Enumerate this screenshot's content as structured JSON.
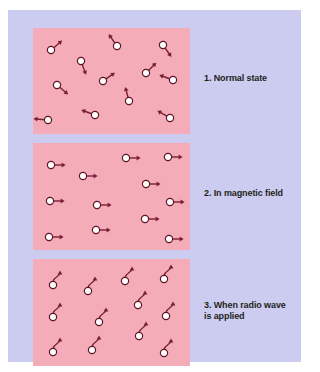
{
  "figure": {
    "background_color": "#ccccf0",
    "panel_color": "#f4adb8",
    "particle_fill": "#ffffff",
    "particle_stroke": "#5c1424",
    "arrow_color": "#7a1f33"
  },
  "captions": {
    "panel_1": "1. Normal state",
    "panel_2": "2. In magnetic field",
    "panel_3": "3. When radio wave\nis applied"
  },
  "chart_data": {
    "type": "diagram",
    "panels": [
      {
        "id": "panel-1",
        "label": "1. Normal state",
        "description": "Spins randomly oriented",
        "arrow_style": "straight",
        "particles": [
          {
            "x": 18,
            "y": 22,
            "angle": -40
          },
          {
            "x": 48,
            "y": 33,
            "angle": 70
          },
          {
            "x": 84,
            "y": 18,
            "angle": -125
          },
          {
            "x": 130,
            "y": 17,
            "angle": 55
          },
          {
            "x": 24,
            "y": 57,
            "angle": 40
          },
          {
            "x": 70,
            "y": 53,
            "angle": -35
          },
          {
            "x": 113,
            "y": 45,
            "angle": -45
          },
          {
            "x": 140,
            "y": 52,
            "angle": -160
          },
          {
            "x": 96,
            "y": 73,
            "angle": -105
          },
          {
            "x": 15,
            "y": 92,
            "angle": 185
          },
          {
            "x": 62,
            "y": 87,
            "angle": -160
          },
          {
            "x": 137,
            "y": 90,
            "angle": -150
          }
        ]
      },
      {
        "id": "panel-2",
        "label": "2. In magnetic field",
        "description": "Spins aligned pointing right",
        "arrow_style": "straight",
        "particles": [
          {
            "x": 18,
            "y": 22,
            "angle": 0
          },
          {
            "x": 50,
            "y": 33,
            "angle": 0
          },
          {
            "x": 93,
            "y": 15,
            "angle": 0
          },
          {
            "x": 135,
            "y": 14,
            "angle": 0
          },
          {
            "x": 113,
            "y": 41,
            "angle": 0
          },
          {
            "x": 17,
            "y": 58,
            "angle": 0
          },
          {
            "x": 64,
            "y": 62,
            "angle": 0
          },
          {
            "x": 137,
            "y": 59,
            "angle": 0
          },
          {
            "x": 112,
            "y": 76,
            "angle": 0
          },
          {
            "x": 16,
            "y": 94,
            "angle": 0
          },
          {
            "x": 63,
            "y": 87,
            "angle": 0
          },
          {
            "x": 136,
            "y": 96,
            "angle": 0
          }
        ]
      },
      {
        "id": "panel-3",
        "label": "3. When radio wave is applied",
        "description": "Spins precessing, curved arrows up-right",
        "arrow_style": "curved",
        "particles": [
          {
            "x": 20,
            "y": 26,
            "angle": 0
          },
          {
            "x": 55,
            "y": 32,
            "angle": 0
          },
          {
            "x": 92,
            "y": 22,
            "angle": 0
          },
          {
            "x": 131,
            "y": 20,
            "angle": 0
          },
          {
            "x": 105,
            "y": 46,
            "angle": 0
          },
          {
            "x": 20,
            "y": 58,
            "angle": 0
          },
          {
            "x": 66,
            "y": 63,
            "angle": 0
          },
          {
            "x": 133,
            "y": 57,
            "angle": 0
          },
          {
            "x": 106,
            "y": 77,
            "angle": 0
          },
          {
            "x": 20,
            "y": 93,
            "angle": 0
          },
          {
            "x": 59,
            "y": 91,
            "angle": 0
          },
          {
            "x": 131,
            "y": 94,
            "angle": 0
          }
        ]
      }
    ]
  }
}
